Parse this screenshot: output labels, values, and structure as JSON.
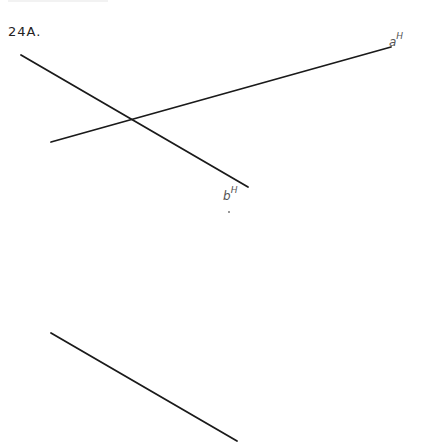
{
  "problem": {
    "label": "24A."
  },
  "labels": {
    "line_a": {
      "base": "a",
      "sup": "H"
    },
    "line_b": {
      "base": "b",
      "sup": "H"
    }
  },
  "lines": [
    {
      "name": "line-b",
      "x1": 21,
      "y1": 55,
      "x2": 248,
      "y2": 187
    },
    {
      "name": "line-a",
      "x1": 51,
      "y1": 142,
      "x2": 391,
      "y2": 47
    },
    {
      "name": "line-c",
      "x1": 51,
      "y1": 333,
      "x2": 237,
      "y2": 441
    }
  ],
  "colors": {
    "line": "#1a1a1a",
    "label": "#555555"
  }
}
